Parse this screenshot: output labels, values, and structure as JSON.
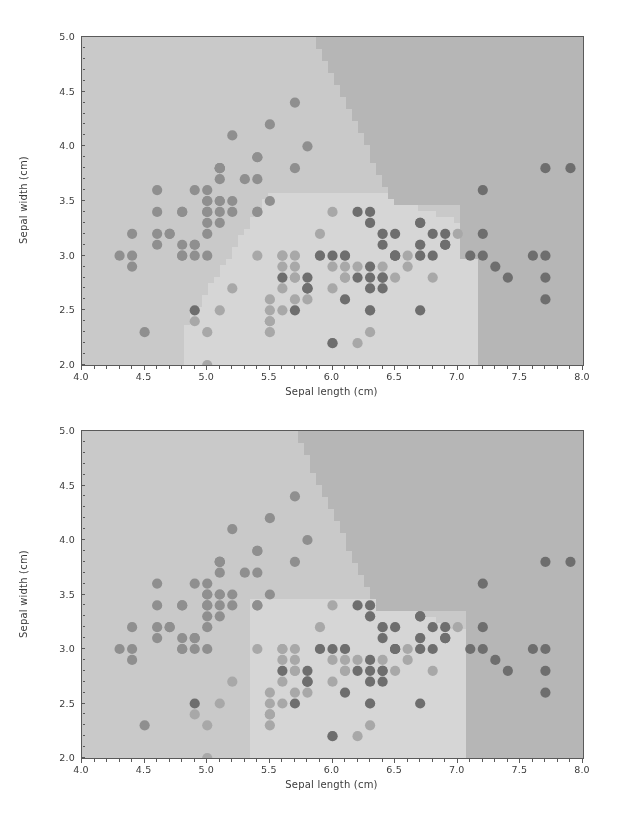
{
  "figure": {
    "background_color": "#ffffff",
    "width": 617,
    "height": 815,
    "rendering": "grayscale"
  },
  "chart_data": [
    {
      "type": "scatter",
      "panel_index": 0,
      "title": "",
      "xlabel": "Sepal length (cm)",
      "ylabel": "Sepal width (cm)",
      "xlim": [
        4.0,
        8.0
      ],
      "ylim": [
        2.0,
        5.0
      ],
      "xticks": [
        4.0,
        4.5,
        5.0,
        5.5,
        6.0,
        6.5,
        7.0,
        7.5,
        8.0
      ],
      "xticklabels": [
        "4.0",
        "4.5",
        "5.0",
        "5.5",
        "6.0",
        "6.5",
        "7.0",
        "7.5",
        "8.0"
      ],
      "yticks": [
        2.0,
        2.5,
        3.0,
        3.5,
        4.0,
        4.5,
        5.0
      ],
      "yticklabels": [
        "2.0",
        "2.5",
        "3.0",
        "3.5",
        "4.0",
        "4.5",
        "5.0"
      ],
      "x_minor_tick_step": 0.1,
      "y_minor_tick_step": 0.1,
      "grid": false,
      "legend": null,
      "annotations": [],
      "axes_facecolor": "#c9c9c9",
      "spine_color": "#5a5a5a",
      "decision_regions": {
        "description": "Classifier decision regions shaded in three gray levels",
        "class_shade_colors": [
          "#c9c9c9",
          "#d6d6d6",
          "#b6b6b6"
        ],
        "boundary_style": "pixelated-staircase",
        "region_cells": {
          "note": "grid of class index per cell, 80 cols x 60 rows over xlim/ylim, row 0 = top (y=5.0)",
          "cols": 80,
          "rows": 60,
          "variant": "panel-0"
        }
      },
      "series": [
        {
          "name": "setosa",
          "marker": "o",
          "color": "#8f8f8f",
          "size": 9,
          "x": [
            5.1,
            4.9,
            4.7,
            4.6,
            5.0,
            5.4,
            4.6,
            5.0,
            4.4,
            4.9,
            5.4,
            4.8,
            4.8,
            4.3,
            5.8,
            5.7,
            5.4,
            5.1,
            5.7,
            5.1,
            5.4,
            5.1,
            4.6,
            5.1,
            4.8,
            5.0,
            5.0,
            5.2,
            5.2,
            4.7,
            4.8,
            5.4,
            5.2,
            5.5,
            4.9,
            5.0,
            5.5,
            4.9,
            4.4,
            5.1,
            5.0,
            4.5,
            4.4,
            5.0,
            5.1,
            4.8,
            5.1,
            4.6,
            5.3,
            5.0
          ],
          "y": [
            3.5,
            3.0,
            3.2,
            3.1,
            3.6,
            3.9,
            3.4,
            3.4,
            2.9,
            3.1,
            3.7,
            3.4,
            3.0,
            3.0,
            4.0,
            4.4,
            3.9,
            3.5,
            3.8,
            3.8,
            3.4,
            3.7,
            3.6,
            3.3,
            3.4,
            3.0,
            3.4,
            3.5,
            3.4,
            3.2,
            3.1,
            3.4,
            4.1,
            4.2,
            3.1,
            3.2,
            3.5,
            3.6,
            3.0,
            3.4,
            3.5,
            2.3,
            3.2,
            3.5,
            3.8,
            3.0,
            3.8,
            3.2,
            3.7,
            3.3
          ]
        },
        {
          "name": "versicolor",
          "marker": "o",
          "color": "#a8a8a8",
          "size": 9,
          "x": [
            7.0,
            6.4,
            6.9,
            5.5,
            6.5,
            5.7,
            6.3,
            4.9,
            6.6,
            5.2,
            5.0,
            5.9,
            6.0,
            6.1,
            5.6,
            6.7,
            5.6,
            5.8,
            6.2,
            5.6,
            5.9,
            6.1,
            6.3,
            6.1,
            6.4,
            6.6,
            6.8,
            6.7,
            6.0,
            5.7,
            5.5,
            5.5,
            5.8,
            6.0,
            5.4,
            6.0,
            6.7,
            6.3,
            5.6,
            5.5,
            5.5,
            6.1,
            5.8,
            5.0,
            5.6,
            5.7,
            5.7,
            6.2,
            5.1,
            5.7
          ],
          "y": [
            3.2,
            3.2,
            3.1,
            2.3,
            2.8,
            2.8,
            3.3,
            2.4,
            2.9,
            2.7,
            2.0,
            3.0,
            2.2,
            2.9,
            2.9,
            3.1,
            3.0,
            2.7,
            2.2,
            2.5,
            3.2,
            2.8,
            2.5,
            2.8,
            2.9,
            3.0,
            2.8,
            3.0,
            2.9,
            2.6,
            2.4,
            2.4,
            2.7,
            2.7,
            3.0,
            3.4,
            3.1,
            2.3,
            3.0,
            2.5,
            2.6,
            3.0,
            2.6,
            2.3,
            2.7,
            3.0,
            2.9,
            2.9,
            2.5,
            2.8
          ]
        },
        {
          "name": "virginica",
          "marker": "o",
          "color": "#6e6e6e",
          "size": 9,
          "x": [
            6.3,
            5.8,
            7.1,
            6.3,
            6.5,
            7.6,
            4.9,
            7.3,
            6.7,
            7.2,
            6.5,
            6.4,
            6.8,
            5.7,
            5.8,
            6.4,
            6.5,
            7.7,
            7.7,
            6.0,
            6.9,
            5.6,
            7.7,
            6.3,
            6.7,
            7.2,
            6.2,
            6.1,
            6.4,
            7.2,
            7.4,
            7.9,
            6.4,
            6.3,
            6.1,
            7.7,
            6.3,
            6.4,
            6.0,
            6.9,
            6.7,
            6.9,
            5.8,
            6.8,
            6.7,
            6.7,
            6.3,
            6.5,
            6.2,
            5.9
          ],
          "y": [
            3.3,
            2.7,
            3.0,
            2.9,
            3.0,
            3.0,
            2.5,
            2.9,
            2.5,
            3.6,
            3.2,
            2.7,
            3.0,
            2.5,
            2.8,
            3.2,
            3.0,
            3.8,
            2.6,
            2.2,
            3.2,
            2.8,
            2.8,
            2.7,
            3.3,
            3.2,
            2.8,
            3.0,
            2.8,
            3.0,
            2.8,
            3.8,
            2.8,
            2.8,
            2.6,
            3.0,
            3.4,
            3.1,
            3.0,
            3.1,
            3.1,
            3.1,
            2.7,
            3.2,
            3.3,
            3.0,
            2.5,
            3.0,
            3.4,
            3.0
          ]
        }
      ]
    },
    {
      "type": "scatter",
      "panel_index": 1,
      "title": "",
      "xlabel": "Sepal length (cm)",
      "ylabel": "Sepal width (cm)",
      "xlim": [
        4.0,
        8.0
      ],
      "ylim": [
        2.0,
        5.0
      ],
      "xticks": [
        4.0,
        4.5,
        5.0,
        5.5,
        6.0,
        6.5,
        7.0,
        7.5,
        8.0
      ],
      "xticklabels": [
        "4.0",
        "4.5",
        "5.0",
        "5.5",
        "6.0",
        "6.5",
        "7.0",
        "7.5",
        "8.0"
      ],
      "yticks": [
        2.0,
        2.5,
        3.0,
        3.5,
        4.0,
        4.5,
        5.0
      ],
      "yticklabels": [
        "2.0",
        "2.5",
        "3.0",
        "3.5",
        "4.0",
        "4.5",
        "5.0"
      ],
      "x_minor_tick_step": 0.1,
      "y_minor_tick_step": 0.1,
      "grid": false,
      "legend": null,
      "annotations": [],
      "axes_facecolor": "#c9c9c9",
      "spine_color": "#5a5a5a",
      "decision_regions": {
        "description": "Classifier decision regions shaded in three gray levels",
        "class_shade_colors": [
          "#c9c9c9",
          "#d6d6d6",
          "#b6b6b6"
        ],
        "boundary_style": "pixelated-staircase",
        "region_cells": {
          "note": "grid of class index per cell, 80 cols x 60 rows over xlim/ylim, row 0 = top (y=5.0)",
          "cols": 80,
          "rows": 60,
          "variant": "panel-1"
        }
      },
      "series": [
        {
          "name": "setosa",
          "marker": "o",
          "color": "#8f8f8f",
          "size": 9,
          "x": [
            5.1,
            4.9,
            4.7,
            4.6,
            5.0,
            5.4,
            4.6,
            5.0,
            4.4,
            4.9,
            5.4,
            4.8,
            4.8,
            4.3,
            5.8,
            5.7,
            5.4,
            5.1,
            5.7,
            5.1,
            5.4,
            5.1,
            4.6,
            5.1,
            4.8,
            5.0,
            5.0,
            5.2,
            5.2,
            4.7,
            4.8,
            5.4,
            5.2,
            5.5,
            4.9,
            5.0,
            5.5,
            4.9,
            4.4,
            5.1,
            5.0,
            4.5,
            4.4,
            5.0,
            5.1,
            4.8,
            5.1,
            4.6,
            5.3,
            5.0
          ],
          "y": [
            3.5,
            3.0,
            3.2,
            3.1,
            3.6,
            3.9,
            3.4,
            3.4,
            2.9,
            3.1,
            3.7,
            3.4,
            3.0,
            3.0,
            4.0,
            4.4,
            3.9,
            3.5,
            3.8,
            3.8,
            3.4,
            3.7,
            3.6,
            3.3,
            3.4,
            3.0,
            3.4,
            3.5,
            3.4,
            3.2,
            3.1,
            3.4,
            4.1,
            4.2,
            3.1,
            3.2,
            3.5,
            3.6,
            3.0,
            3.4,
            3.5,
            2.3,
            3.2,
            3.5,
            3.8,
            3.0,
            3.8,
            3.2,
            3.7,
            3.3
          ]
        },
        {
          "name": "versicolor",
          "marker": "o",
          "color": "#a8a8a8",
          "size": 9,
          "x": [
            7.0,
            6.4,
            6.9,
            5.5,
            6.5,
            5.7,
            6.3,
            4.9,
            6.6,
            5.2,
            5.0,
            5.9,
            6.0,
            6.1,
            5.6,
            6.7,
            5.6,
            5.8,
            6.2,
            5.6,
            5.9,
            6.1,
            6.3,
            6.1,
            6.4,
            6.6,
            6.8,
            6.7,
            6.0,
            5.7,
            5.5,
            5.5,
            5.8,
            6.0,
            5.4,
            6.0,
            6.7,
            6.3,
            5.6,
            5.5,
            5.5,
            6.1,
            5.8,
            5.0,
            5.6,
            5.7,
            5.7,
            6.2,
            5.1,
            5.7
          ],
          "y": [
            3.2,
            3.2,
            3.1,
            2.3,
            2.8,
            2.8,
            3.3,
            2.4,
            2.9,
            2.7,
            2.0,
            3.0,
            2.2,
            2.9,
            2.9,
            3.1,
            3.0,
            2.7,
            2.2,
            2.5,
            3.2,
            2.8,
            2.5,
            2.8,
            2.9,
            3.0,
            2.8,
            3.0,
            2.9,
            2.6,
            2.4,
            2.4,
            2.7,
            2.7,
            3.0,
            3.4,
            3.1,
            2.3,
            3.0,
            2.5,
            2.6,
            3.0,
            2.6,
            2.3,
            2.7,
            3.0,
            2.9,
            2.9,
            2.5,
            2.8
          ]
        },
        {
          "name": "virginica",
          "marker": "o",
          "color": "#6e6e6e",
          "size": 9,
          "x": [
            6.3,
            5.8,
            7.1,
            6.3,
            6.5,
            7.6,
            4.9,
            7.3,
            6.7,
            7.2,
            6.5,
            6.4,
            6.8,
            5.7,
            5.8,
            6.4,
            6.5,
            7.7,
            7.7,
            6.0,
            6.9,
            5.6,
            7.7,
            6.3,
            6.7,
            7.2,
            6.2,
            6.1,
            6.4,
            7.2,
            7.4,
            7.9,
            6.4,
            6.3,
            6.1,
            7.7,
            6.3,
            6.4,
            6.0,
            6.9,
            6.7,
            6.9,
            5.8,
            6.8,
            6.7,
            6.7,
            6.3,
            6.5,
            6.2,
            5.9
          ],
          "y": [
            3.3,
            2.7,
            3.0,
            2.9,
            3.0,
            3.0,
            2.5,
            2.9,
            2.5,
            3.6,
            3.2,
            2.7,
            3.0,
            2.5,
            2.8,
            3.2,
            3.0,
            3.8,
            2.6,
            2.2,
            3.2,
            2.8,
            2.8,
            2.7,
            3.3,
            3.2,
            2.8,
            3.0,
            2.8,
            3.0,
            2.8,
            3.8,
            2.8,
            2.8,
            2.6,
            3.0,
            3.4,
            3.1,
            3.0,
            3.1,
            3.1,
            3.1,
            2.7,
            3.2,
            3.3,
            3.0,
            2.5,
            3.0,
            3.4,
            3.0
          ]
        }
      ]
    }
  ]
}
